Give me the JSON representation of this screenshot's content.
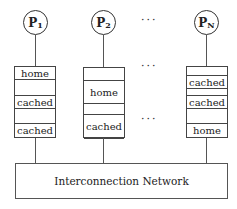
{
  "processors": [
    {
      "label": "P",
      "sub": "1"
    },
    {
      "label": "P",
      "sub": "2"
    },
    {
      "label": "P",
      "sub": "N"
    }
  ],
  "ellipsis": "···",
  "memories": [
    {
      "rows": [
        "home",
        "",
        "cached",
        "",
        "cached"
      ]
    },
    {
      "rows": [
        "",
        "home",
        "",
        "cached"
      ]
    },
    {
      "rows": [
        "",
        "cached",
        "cached",
        "",
        "home"
      ]
    }
  ],
  "network": {
    "label": "Interconnection Network"
  }
}
